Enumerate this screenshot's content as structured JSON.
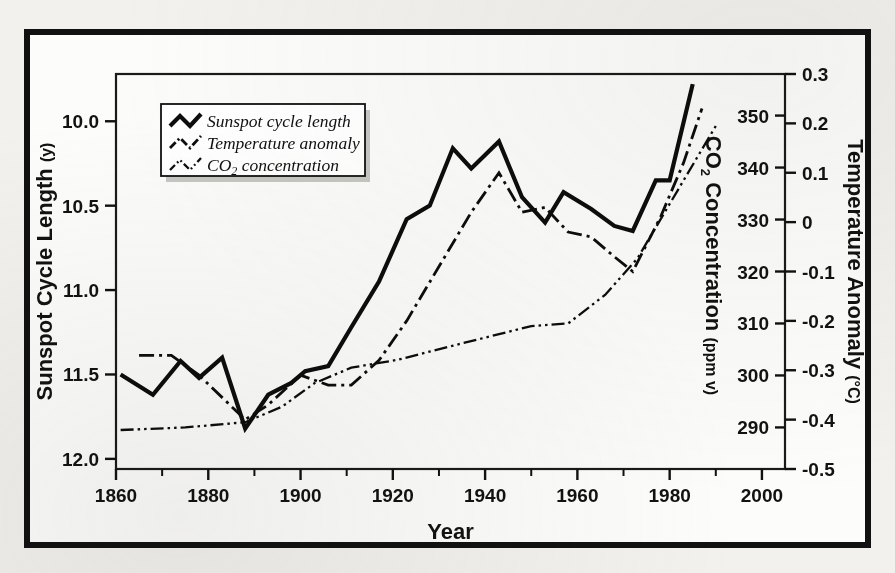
{
  "figure": {
    "background_color": "#f2f1ee",
    "frame_color": "#111111",
    "plot_background": "#fbfbfa"
  },
  "axes": {
    "x": {
      "title": "Year",
      "ticks": [
        "1860",
        "1880",
        "1900",
        "1920",
        "1940",
        "1960",
        "1980",
        "2000"
      ],
      "tick_values": [
        1860,
        1880,
        1900,
        1920,
        1940,
        1960,
        1980,
        2000
      ],
      "minor_tick_values": [
        1870,
        1890,
        1910,
        1930,
        1950,
        1970,
        1990
      ],
      "range": [
        1860,
        2005
      ]
    },
    "y_left": {
      "title": "Sunspot Cycle Length",
      "title_unit": "(y)",
      "ticks": [
        "10.0",
        "10.5",
        "11.0",
        "11.5",
        "12.0"
      ],
      "tick_values": [
        10.0,
        10.5,
        11.0,
        11.5,
        12.0
      ],
      "range": [
        9.72,
        12.06
      ],
      "inverted": true
    },
    "y_right_inner": {
      "title": "CO",
      "title_sub": "2",
      "title_rest": " Concentration",
      "title_unit": "(ppm v)",
      "ticks": [
        "350",
        "340",
        "330",
        "320",
        "310",
        "300",
        "290"
      ],
      "tick_values": [
        350,
        340,
        330,
        320,
        310,
        300,
        290
      ],
      "range": [
        282,
        358
      ]
    },
    "y_right_outer": {
      "title": "Temperature Anomaly",
      "title_unit": "(°C)",
      "ticks": [
        "0.3",
        "0.2",
        "0.1",
        "0",
        "-0.1",
        "-0.2",
        "-0.3",
        "-0.4",
        "-0.5"
      ],
      "tick_values": [
        0.3,
        0.2,
        0.1,
        0,
        -0.1,
        -0.2,
        -0.3,
        -0.4,
        -0.5
      ],
      "range": [
        -0.5,
        0.3
      ]
    }
  },
  "legend": {
    "items": [
      {
        "label": "Sunspot cycle length",
        "style": "solid",
        "name": "sunspot-cycle-length"
      },
      {
        "label": "Temperature anomaly",
        "style": "dash-dot",
        "name": "temperature-anomaly"
      },
      {
        "label": "CO",
        "sub": "2",
        "label_rest": " concentration",
        "style": "dash-dot-dot",
        "name": "co2-concentration"
      }
    ]
  },
  "chart_data": {
    "type": "line",
    "title": "",
    "xlabel": "Year",
    "ylabel": "Sunspot Cycle Length (y)",
    "grid": false,
    "legend_position": "upper-left-inside",
    "xlim": [
      1860,
      2005
    ],
    "series": [
      {
        "name": "Sunspot cycle length",
        "style": "solid",
        "axis": "y_left",
        "ylabel": "Sunspot Cycle Length (y)",
        "ylim": [
          9.72,
          12.06
        ],
        "inverted_axis": true,
        "x": [
          1861,
          1868,
          1874,
          1878,
          1883,
          1888,
          1893,
          1898,
          1901,
          1906,
          1911,
          1917,
          1923,
          1928,
          1933,
          1937,
          1943,
          1948,
          1953,
          1957,
          1963,
          1968,
          1972,
          1977,
          1980,
          1985
        ],
        "y": [
          11.5,
          11.62,
          11.42,
          11.52,
          11.4,
          11.82,
          11.62,
          11.55,
          11.48,
          11.45,
          11.22,
          10.95,
          10.58,
          10.5,
          10.16,
          10.28,
          10.12,
          10.45,
          10.6,
          10.42,
          10.52,
          10.62,
          10.65,
          10.35,
          10.35,
          9.78
        ]
      },
      {
        "name": "Temperature anomaly",
        "style": "dash-dot",
        "axis": "y_right_outer",
        "ylabel": "Temperature Anomaly (°C)",
        "ylim": [
          -0.5,
          0.3
        ],
        "x": [
          1865,
          1872,
          1878,
          1888,
          1893,
          1900,
          1906,
          1911,
          1917,
          1923,
          1930,
          1937,
          1943,
          1948,
          1953,
          1958,
          1963,
          1968,
          1972,
          1978,
          1983,
          1987
        ],
        "y": [
          -0.27,
          -0.27,
          -0.31,
          -0.4,
          -0.37,
          -0.31,
          -0.33,
          -0.33,
          -0.28,
          -0.2,
          -0.09,
          0.02,
          0.1,
          0.02,
          0.03,
          -0.02,
          -0.03,
          -0.07,
          -0.1,
          0.01,
          0.12,
          0.23
        ]
      },
      {
        "name": "CO2 concentration",
        "style": "dash-dot-dot",
        "axis": "y_right_inner",
        "ylabel": "CO2 Concentration (ppm v)",
        "ylim": [
          282,
          358
        ],
        "x": [
          1861,
          1875,
          1888,
          1896,
          1903,
          1911,
          1921,
          1932,
          1941,
          1950,
          1958,
          1966,
          1973,
          1980,
          1990
        ],
        "y": [
          289.5,
          290.0,
          291.0,
          294.0,
          298.5,
          301.5,
          303.0,
          305.5,
          307.5,
          309.5,
          310.0,
          315.5,
          322.5,
          333.0,
          348.0
        ]
      }
    ]
  }
}
